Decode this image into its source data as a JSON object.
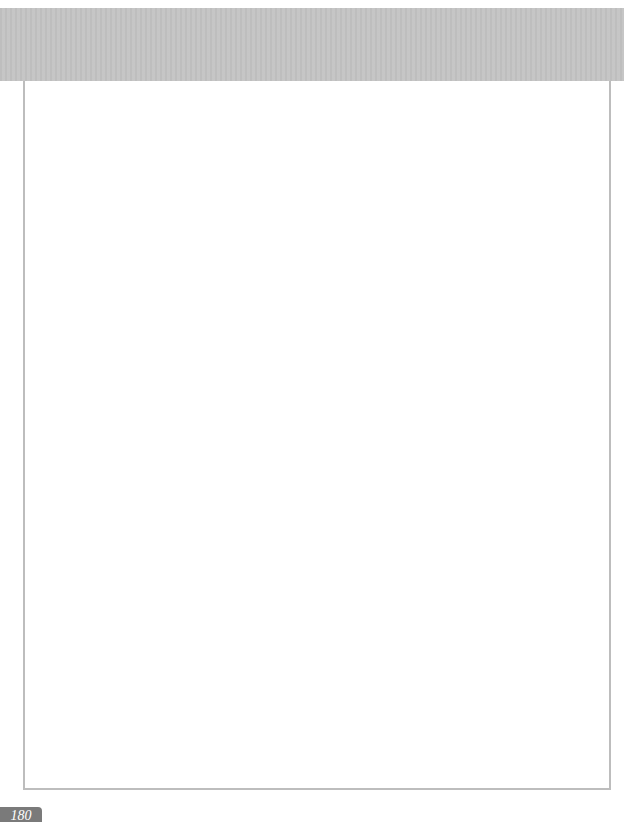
{
  "page": {
    "number": "180"
  },
  "colors": {
    "header_band": "#c4c4c4",
    "frame_border": "#bdbdbd",
    "page_tab": "#7a7a7a"
  }
}
